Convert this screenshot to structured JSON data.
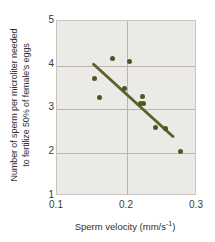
{
  "chart_data": {
    "type": "scatter",
    "title": "",
    "xlabel": "Sperm velocity (mm/s⁻¹)",
    "xlabel_text": "Sperm velocity (mm/s",
    "xlabel_sup": "-1",
    "xlabel_tail": ")",
    "ylabel_line1": "Number of sperm per microliter needed",
    "ylabel_line2": "to fertilize 50% of female's eggs",
    "xlim": [
      0.1,
      0.3
    ],
    "ylim": [
      1,
      5
    ],
    "xticks": [
      0.1,
      0.2,
      0.3
    ],
    "xtick_labels": [
      "0.1",
      "0.2",
      "0.3"
    ],
    "yticks": [
      1,
      2,
      3,
      4,
      5
    ],
    "ytick_labels": [
      "1",
      "2",
      "3",
      "4",
      "5"
    ],
    "grid": true,
    "gridlines_y": [
      2,
      3,
      4
    ],
    "gridlines_x": [
      0.2
    ],
    "legend": null,
    "marker_color": "#4e5526",
    "trendline_color": "#5b6328",
    "plot_background": "#eceae6",
    "points": [
      {
        "x": 0.154,
        "y": 3.68
      },
      {
        "x": 0.161,
        "y": 3.26
      },
      {
        "x": 0.179,
        "y": 4.14
      },
      {
        "x": 0.197,
        "y": 3.45
      },
      {
        "x": 0.204,
        "y": 4.08
      },
      {
        "x": 0.219,
        "y": 3.12
      },
      {
        "x": 0.222,
        "y": 3.27
      },
      {
        "x": 0.224,
        "y": 3.11
      },
      {
        "x": 0.24,
        "y": 2.56
      },
      {
        "x": 0.255,
        "y": 2.55
      },
      {
        "x": 0.276,
        "y": 2.01
      }
    ],
    "trendline": {
      "x0": 0.153,
      "y0": 4.0,
      "x1": 0.268,
      "y1": 2.33
    }
  }
}
